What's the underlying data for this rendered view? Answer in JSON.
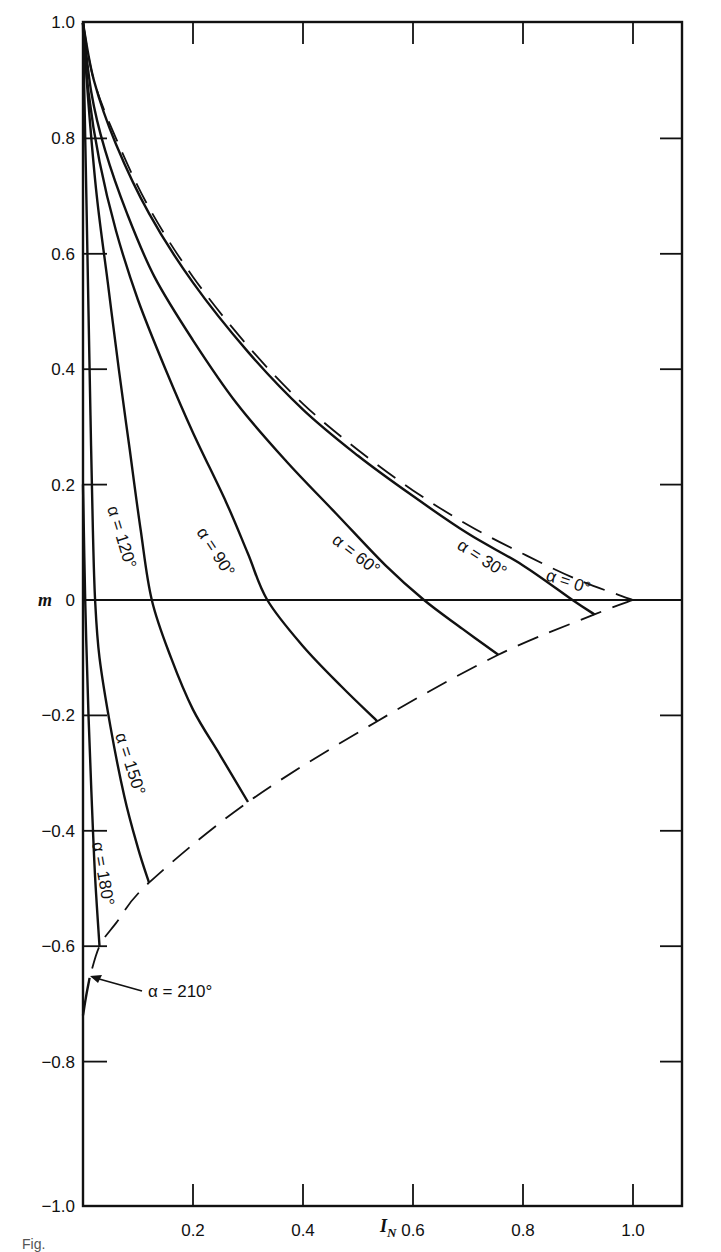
{
  "chart_data": {
    "type": "line",
    "title": "",
    "xlabel": "I_N",
    "ylabel": "m",
    "xlim": [
      0,
      1.1
    ],
    "ylim": [
      -1.0,
      1.0
    ],
    "x_ticks": [
      0.2,
      0.4,
      0.6,
      0.8,
      1.0
    ],
    "x_tick_labels": [
      "0.2",
      "0.4",
      "0.6",
      "0.8",
      "1.0"
    ],
    "y_ticks": [
      1.0,
      0.8,
      0.6,
      0.4,
      0.2,
      0,
      -0.2,
      -0.4,
      -0.6,
      -0.8,
      -1.0
    ],
    "y_tick_labels": [
      "1.0",
      "0.8",
      "0.6",
      "0.4",
      "0.2",
      "0",
      "−0.2",
      "−0.4",
      "−0.6",
      "−0.8",
      "−1.0"
    ],
    "grid": false,
    "reference_line": {
      "m": 0,
      "style": "solid"
    },
    "series": [
      {
        "name": "α = 0°",
        "style": "dashed",
        "label": "α = 0°",
        "points": [
          [
            0.0,
            1.0
          ],
          [
            0.02,
            0.9
          ],
          [
            0.06,
            0.8
          ],
          [
            0.12,
            0.68
          ],
          [
            0.2,
            0.56
          ],
          [
            0.3,
            0.44
          ],
          [
            0.4,
            0.34
          ],
          [
            0.5,
            0.26
          ],
          [
            0.6,
            0.19
          ],
          [
            0.7,
            0.13
          ],
          [
            0.8,
            0.08
          ],
          [
            0.9,
            0.035
          ],
          [
            1.0,
            0.0
          ]
        ]
      },
      {
        "name": "α = 30°",
        "style": "solid",
        "label": "α = 30°",
        "points": [
          [
            0.0,
            1.0
          ],
          [
            0.02,
            0.9
          ],
          [
            0.06,
            0.79
          ],
          [
            0.12,
            0.67
          ],
          [
            0.2,
            0.55
          ],
          [
            0.3,
            0.43
          ],
          [
            0.4,
            0.33
          ],
          [
            0.5,
            0.25
          ],
          [
            0.6,
            0.18
          ],
          [
            0.7,
            0.115
          ],
          [
            0.8,
            0.06
          ],
          [
            0.89,
            0.0
          ],
          [
            0.93,
            -0.025
          ]
        ]
      },
      {
        "name": "α = 60°",
        "style": "solid",
        "label": "α = 60°",
        "points": [
          [
            0.0,
            1.0
          ],
          [
            0.015,
            0.88
          ],
          [
            0.04,
            0.78
          ],
          [
            0.08,
            0.67
          ],
          [
            0.13,
            0.56
          ],
          [
            0.2,
            0.45
          ],
          [
            0.28,
            0.34
          ],
          [
            0.37,
            0.24
          ],
          [
            0.46,
            0.15
          ],
          [
            0.55,
            0.06
          ],
          [
            0.62,
            0.0
          ],
          [
            0.69,
            -0.05
          ],
          [
            0.755,
            -0.095
          ]
        ]
      },
      {
        "name": "α = 90°",
        "style": "solid",
        "label": "α = 90°",
        "points": [
          [
            0.0,
            1.0
          ],
          [
            0.01,
            0.88
          ],
          [
            0.03,
            0.76
          ],
          [
            0.06,
            0.64
          ],
          [
            0.1,
            0.52
          ],
          [
            0.15,
            0.4
          ],
          [
            0.2,
            0.29
          ],
          [
            0.26,
            0.17
          ],
          [
            0.3,
            0.08
          ],
          [
            0.335,
            0.0
          ],
          [
            0.4,
            -0.08
          ],
          [
            0.47,
            -0.15
          ],
          [
            0.535,
            -0.21
          ]
        ]
      },
      {
        "name": "α = 120°",
        "style": "solid",
        "label": "α = 120°",
        "points": [
          [
            0.0,
            1.0
          ],
          [
            0.01,
            0.86
          ],
          [
            0.025,
            0.7
          ],
          [
            0.045,
            0.55
          ],
          [
            0.065,
            0.4
          ],
          [
            0.085,
            0.26
          ],
          [
            0.105,
            0.12
          ],
          [
            0.125,
            0.0
          ],
          [
            0.16,
            -0.1
          ],
          [
            0.2,
            -0.19
          ],
          [
            0.25,
            -0.27
          ],
          [
            0.3,
            -0.35
          ]
        ]
      },
      {
        "name": "α = 150°",
        "style": "solid",
        "label": "α = 150°",
        "points": [
          [
            0.0,
            1.0
          ],
          [
            0.005,
            0.75
          ],
          [
            0.01,
            0.5
          ],
          [
            0.014,
            0.3
          ],
          [
            0.018,
            0.12
          ],
          [
            0.022,
            0.0
          ],
          [
            0.03,
            -0.1
          ],
          [
            0.05,
            -0.22
          ],
          [
            0.075,
            -0.34
          ],
          [
            0.1,
            -0.43
          ],
          [
            0.12,
            -0.49
          ]
        ]
      },
      {
        "name": "α = 180°",
        "style": "solid",
        "label": "α = 180°",
        "points": [
          [
            0.0,
            0.2
          ],
          [
            0.004,
            0.0
          ],
          [
            0.01,
            -0.2
          ],
          [
            0.016,
            -0.35
          ],
          [
            0.022,
            -0.48
          ],
          [
            0.03,
            -0.6
          ]
        ]
      },
      {
        "name": "α = 210°",
        "style": "solid",
        "label": "α = 210°",
        "points": [
          [
            0.0,
            -0.72
          ],
          [
            0.005,
            -0.69
          ],
          [
            0.012,
            -0.655
          ]
        ]
      },
      {
        "name": "lower envelope",
        "style": "dashed",
        "label": "",
        "points": [
          [
            1.0,
            0.0
          ],
          [
            0.93,
            -0.025
          ],
          [
            0.755,
            -0.095
          ],
          [
            0.535,
            -0.21
          ],
          [
            0.3,
            -0.35
          ],
          [
            0.12,
            -0.49
          ],
          [
            0.06,
            -0.56
          ],
          [
            0.03,
            -0.6
          ],
          [
            0.012,
            -0.655
          ]
        ]
      }
    ],
    "annotations": [
      {
        "text": "α = 210°",
        "arrow_to": [
          0.012,
          -0.655
        ],
        "text_at": [
          0.05,
          -0.68
        ]
      }
    ]
  },
  "axes": {
    "x_title": "I",
    "x_title_sub": "N",
    "y_title": "m"
  },
  "labels": {
    "a0": "α = 0°",
    "a30": "α = 30°",
    "a60": "α = 60°",
    "a90": "α = 90°",
    "a120": "α = 120°",
    "a150": "α = 150°",
    "a180": "α = 180°",
    "a210": "α = 210°"
  },
  "caption": "Fig."
}
